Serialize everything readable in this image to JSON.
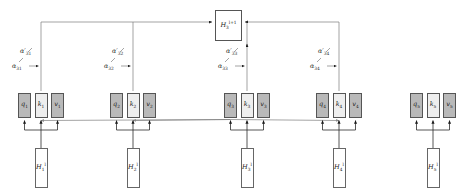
{
  "figure": {
    "type": "attention-diagram"
  },
  "output_node": {
    "base": "H",
    "sub": "3",
    "sup": "l+1"
  },
  "nodes": [
    {
      "id": 1,
      "x": 18,
      "state": {
        "base": "H",
        "sub": "1",
        "sup": "l"
      },
      "q": {
        "base": "q",
        "sub": "1"
      },
      "k": {
        "base": "k",
        "sub": "1"
      },
      "v": {
        "base": "v",
        "sub": "1"
      },
      "alpha": {
        "base": "α",
        "sub": "31"
      },
      "alpha_prime": {
        "base": "α",
        "sub": "31",
        "prime": "′"
      },
      "attended": true
    },
    {
      "id": 2,
      "x": 110,
      "state": {
        "base": "H",
        "sub": "2",
        "sup": "l"
      },
      "q": {
        "base": "q",
        "sub": "2"
      },
      "k": {
        "base": "k",
        "sub": "2"
      },
      "v": {
        "base": "v",
        "sub": "2"
      },
      "alpha": {
        "base": "α",
        "sub": "32"
      },
      "alpha_prime": {
        "base": "α",
        "sub": "32",
        "prime": "′"
      },
      "attended": true
    },
    {
      "id": 3,
      "x": 224,
      "state": {
        "base": "H",
        "sub": "3",
        "sup": "l"
      },
      "q": {
        "base": "q",
        "sub": "3"
      },
      "k": {
        "base": "k",
        "sub": "3"
      },
      "v": {
        "base": "v",
        "sub": "3"
      },
      "alpha": {
        "base": "α",
        "sub": "33"
      },
      "alpha_prime": {
        "base": "α",
        "sub": "33",
        "prime": "′"
      },
      "attended": true
    },
    {
      "id": 4,
      "x": 316,
      "state": {
        "base": "H",
        "sub": "4",
        "sup": "l"
      },
      "q": {
        "base": "q",
        "sub": "4"
      },
      "k": {
        "base": "k",
        "sub": "4"
      },
      "v": {
        "base": "v",
        "sub": "4"
      },
      "alpha": {
        "base": "α",
        "sub": "34"
      },
      "alpha_prime": {
        "base": "α",
        "sub": "34",
        "prime": "′"
      },
      "attended": true
    },
    {
      "id": 5,
      "x": 410,
      "state": {
        "base": "H",
        "sub": "5",
        "sup": "l"
      },
      "q": {
        "base": "q",
        "sub": "5"
      },
      "k": {
        "base": "k",
        "sub": "5"
      },
      "v": {
        "base": "v",
        "sub": "5"
      },
      "attended": false
    }
  ],
  "colors": {
    "query_fill": "#b9b9b9",
    "key_fill": "#eeeeee",
    "value_fill": "#b9b9b9",
    "box_stroke": "#555555",
    "line": "#808080",
    "arrow": "#1a1a1a",
    "background": "#ffffff"
  }
}
